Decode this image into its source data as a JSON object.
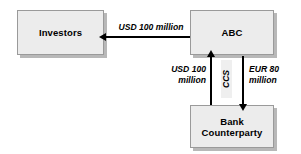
{
  "diagram": {
    "type": "flow-diagram",
    "background_color": "#ffffff",
    "node_fill_color": "#ececec",
    "node_border_color": "#9a9a9a",
    "connector_color": "#000000",
    "nodes": [
      {
        "id": "investors",
        "label": "Investors"
      },
      {
        "id": "abc",
        "label": "ABC"
      },
      {
        "id": "bank",
        "label": "Bank\nCounterparty"
      }
    ],
    "edges": [
      {
        "id": "abc-to-investors",
        "from": "abc",
        "to": "investors",
        "direction": "left",
        "label": "USD 100 million"
      },
      {
        "id": "bank-to-abc",
        "from": "bank",
        "to": "abc",
        "direction": "up",
        "label": "USD 100\nmillion"
      },
      {
        "id": "abc-to-bank",
        "from": "abc",
        "to": "bank",
        "direction": "down",
        "label": "EUR 80\nmillion"
      }
    ],
    "annotations": [
      {
        "id": "ccs",
        "label": "CCS",
        "orientation": "vertical-bottom-to-top"
      }
    ]
  }
}
